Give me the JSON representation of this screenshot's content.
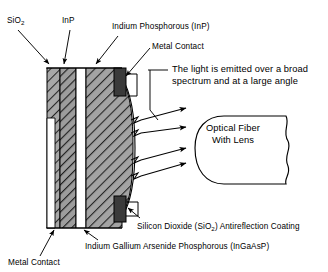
{
  "figure": {
    "type": "cross-section-diagram"
  },
  "labels": {
    "sio2_top": "SiO",
    "sio2_top_sub": "2",
    "inp_top": "InP",
    "inp_full": "Indium Phosphorous (InP)",
    "metal_contact_top": "Metal Contact",
    "emission_line1": "The light is emitted over a broad",
    "emission_line2": "spectrum and at a large angle",
    "fiber_line1": "Optical Fiber",
    "fiber_line2": "With Lens",
    "ar_coating_pre": "Silicon Dioxide (SiO",
    "ar_coating_sub": "2",
    "ar_coating_post": ") Antireflection Coating",
    "ingaasp": "Indium Gallium Arsenide Phosphorous (InGaAsP)",
    "metal_contact_bottom": "Metal Contact"
  },
  "colors": {
    "stroke": "#000000",
    "background": "#ffffff",
    "layer_sio2_fill": "#a8a8a8",
    "layer_inp_fill": "#9a9a9a",
    "layer_active_fill": "#a0a0a0",
    "layer_white_fill": "#ffffff",
    "metal_contact_fill": "#3a3a3a",
    "hatch_stroke": "#2b2b2b"
  },
  "structure": {
    "layers": [
      {
        "name": "sio2-left-layer",
        "hatched": true,
        "shade": "gray"
      },
      {
        "name": "inp-layer",
        "hatched": true,
        "shade": "gray"
      },
      {
        "name": "white-active-stripe",
        "hatched": false,
        "shade": "white"
      },
      {
        "name": "ingaasp-substrate",
        "hatched": true,
        "shade": "gray"
      },
      {
        "name": "metal-contact-top",
        "hatched": false,
        "shade": "dark"
      },
      {
        "name": "metal-contact-bottom",
        "hatched": false,
        "shade": "dark"
      }
    ],
    "emission_beams": 6,
    "beam_groups": 2
  }
}
